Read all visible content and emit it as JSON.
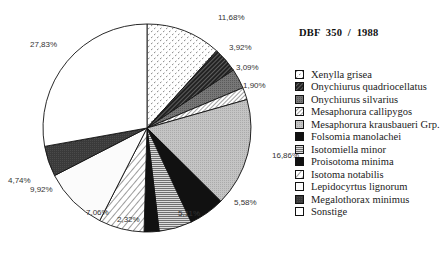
{
  "chart_data": {
    "type": "pie",
    "title": "DBF  350  /  1988",
    "start_angle": "12 o'clock",
    "direction": "clockwise",
    "legend_position": "right",
    "slices": [
      {
        "name": "Xenylla grisea",
        "value": 11.68,
        "label": "11,68%",
        "pattern": "dots"
      },
      {
        "name": "Onychiurus quadriocellatus",
        "value": 3.92,
        "label": "3,92%",
        "pattern": "dark-diagonal"
      },
      {
        "name": "Onychiurus silvarius",
        "value": 3.09,
        "label": "3,09%",
        "pattern": "mid-gray"
      },
      {
        "name": "Mesaphorura callipygos",
        "value": 1.9,
        "label": "1,90%",
        "pattern": "light-diagonal"
      },
      {
        "name": "Mesaphorura krausbaueri Grp.",
        "value": 16.86,
        "label": "16,86%",
        "pattern": "light-gray"
      },
      {
        "name": "Folsomia manolachei",
        "value": 5.58,
        "label": "5,58%",
        "pattern": "black"
      },
      {
        "name": "Isotomiella minor",
        "value": 5.11,
        "label": "5,11%",
        "pattern": "horizontal-lines"
      },
      {
        "name": "Proisotoma minima",
        "value": 2.32,
        "label": "2,32%",
        "pattern": "black"
      },
      {
        "name": "Isotoma notabilis",
        "value": 7.06,
        "label": "7,06%",
        "pattern": "wide-diagonal"
      },
      {
        "name": "Lepidocyrtus lignorum",
        "value": 9.92,
        "label": "9,92%",
        "pattern": "very-light"
      },
      {
        "name": "Megalothorax minimus",
        "value": 4.74,
        "label": "4,74%",
        "pattern": "dark-gray"
      },
      {
        "name": "Sonstige",
        "value": 27.83,
        "label": "27,83%",
        "pattern": "white"
      }
    ]
  },
  "legend": {
    "items": [
      "Xenylla grisea",
      "Onychiurus quadriocellatus",
      "Onychiurus silvarius",
      "Mesaphorura callipygos",
      "Mesaphorura krausbaueri Grp.",
      "Folsomia manolachei",
      "Isotomiella minor",
      "Proisotoma minima",
      "Isotoma notabilis",
      "Lepidocyrtus lignorum",
      "Megalothorax minimus",
      "Sonstige"
    ]
  },
  "colors": {
    "outline": "#111111",
    "background": "#ffffff"
  }
}
